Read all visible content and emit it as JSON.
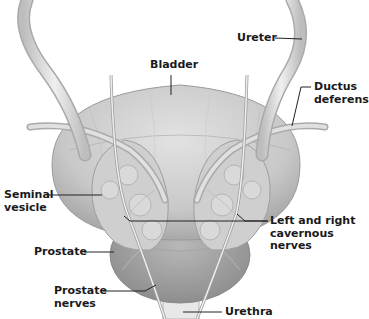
{
  "diagram": {
    "colors": {
      "background": "#ffffff",
      "tissue_light": "#d6d6d6",
      "tissue_mid": "#bdbdbd",
      "tissue_dark": "#9a9a9a",
      "tube": "#e4e4e4",
      "leader_line": "#222222",
      "text": "#1a1a1a"
    },
    "labels": {
      "ureter": "Ureter",
      "bladder": "Bladder",
      "ductus_line1": "Ductus",
      "ductus_line2": "deferens",
      "seminal_line1": "Seminal",
      "seminal_line2": "vesicle",
      "cavernous_line1": "Left and right",
      "cavernous_line2": "cavernous",
      "cavernous_line3": "nerves",
      "prostate": "Prostate",
      "prostate_nerves_line1": "Prostate",
      "prostate_nerves_line2": "nerves",
      "urethra": "Urethra"
    }
  }
}
